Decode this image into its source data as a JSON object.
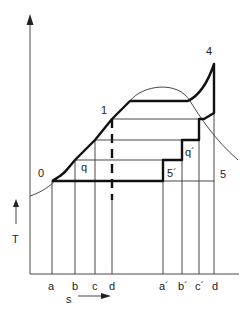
{
  "diagram": {
    "type": "T-s diagram",
    "y_axis_label": "T",
    "x_axis_label": "s",
    "points": {
      "p0": "0",
      "p1": "1",
      "p4": "4",
      "p5": "5",
      "p5prime": "5´",
      "q": "q",
      "qprime": "q´"
    },
    "x_ticks": [
      "a",
      "b",
      "c",
      "d",
      "a´",
      "b´",
      "c´",
      "d"
    ],
    "colors": {
      "line": "#333333",
      "thick_line": "#111111",
      "background": "#ffffff"
    }
  }
}
